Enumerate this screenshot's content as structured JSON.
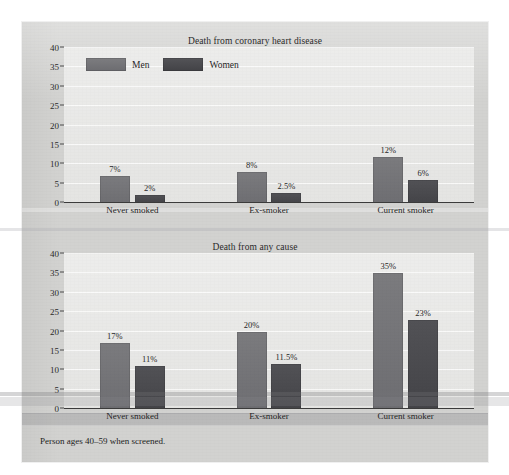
{
  "figure": {
    "footnote": "Person ages 40–59 when screened.",
    "background_color": "#d2d2d0",
    "plot_background_color": "#e3e3e1"
  },
  "legend": {
    "men_label": "Men",
    "women_label": "Women",
    "men_color": "#757578",
    "women_color": "#4b4b4f"
  },
  "chart_data": [
    {
      "type": "bar",
      "id": "death-from-coronary-heart-disease",
      "title": "Death from coronary heart disease",
      "xlabel": "",
      "ylabel": "",
      "ylim": [
        0,
        40
      ],
      "yticks": [
        0,
        5,
        10,
        15,
        20,
        25,
        30,
        35,
        40
      ],
      "ytick_labels": [
        "0",
        "5",
        "10",
        "15",
        "20",
        "25",
        "30",
        "35",
        "40"
      ],
      "grid": true,
      "legend_position": "upper-left-inside",
      "categories": [
        "Never smoked",
        "Ex-smoker",
        "Current smoker"
      ],
      "series": [
        {
          "name": "Men",
          "color": "#757578",
          "values": [
            7,
            8,
            12
          ],
          "labels": [
            "7%",
            "8%",
            "12%"
          ]
        },
        {
          "name": "Women",
          "color": "#4b4b4f",
          "values": [
            2,
            2.5,
            6
          ],
          "labels": [
            "2%",
            "2.5%",
            "6%"
          ]
        }
      ]
    },
    {
      "type": "bar",
      "id": "death-from-any-cause",
      "title": "Death from any cause",
      "xlabel": "",
      "ylabel": "",
      "ylim": [
        0,
        40
      ],
      "yticks": [
        0,
        5,
        10,
        15,
        20,
        25,
        30,
        35,
        40
      ],
      "ytick_labels": [
        "0",
        "5",
        "10",
        "15",
        "20",
        "25",
        "30",
        "35",
        "40"
      ],
      "grid": true,
      "legend_position": "none",
      "categories": [
        "Never smoked",
        "Ex-smoker",
        "Current smoker"
      ],
      "series": [
        {
          "name": "Men",
          "color": "#757578",
          "values": [
            17,
            20,
            35
          ],
          "labels": [
            "17%",
            "20%",
            "35%"
          ]
        },
        {
          "name": "Women",
          "color": "#4b4b4f",
          "values": [
            11,
            11.5,
            23
          ],
          "labels": [
            "11%",
            "11.5%",
            "23%"
          ]
        }
      ]
    }
  ]
}
